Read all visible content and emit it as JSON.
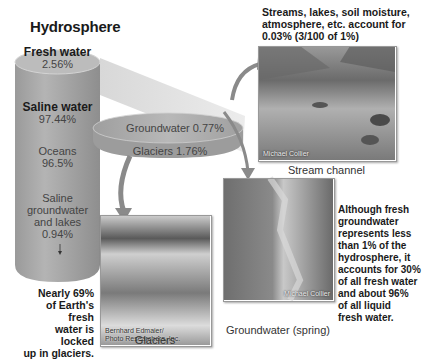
{
  "title": "Hydrosphere",
  "cylinder": {
    "fresh_label": "Fresh water",
    "fresh_value": "2.56%",
    "saline_label": "Saline water",
    "saline_value": "97.44%",
    "oceans_label": "Oceans",
    "oceans_value": "96.5%",
    "saline_gw_line1": "Saline",
    "saline_gw_line2": "groundwater",
    "saline_gw_line3": "and lakes",
    "saline_gw_value": "0.94%"
  },
  "disk": {
    "groundwater": "Groundwater 0.77%",
    "glaciers": "Glaciers 1.76%"
  },
  "streams_note": {
    "line1": "Streams, lakes, soil moisture,",
    "line2": "atmosphere, etc. account for",
    "line3": "0.03% (3/100 of 1%)"
  },
  "photos": {
    "stream": {
      "caption": "Stream channel",
      "credit": "Michael Collier"
    },
    "glaciers": {
      "caption": "Glaciers",
      "credit_line1": "Bernhard Edmaier/",
      "credit_line2": "Photo Researchers, Inc."
    },
    "spring": {
      "caption": "Groundwater (spring)",
      "credit": "Michael Collier"
    }
  },
  "glacier_note": {
    "line1": "Nearly 69%",
    "line2": "of Earth's fresh",
    "line3": "water is locked",
    "line4": "up in glaciers."
  },
  "groundwater_note": {
    "line1": "Although fresh",
    "line2": "groundwater",
    "line3": "represents less",
    "line4": "than 1% of the",
    "line5": "hydrosphere, it",
    "line6": "accounts for 30%",
    "line7": "of all fresh water",
    "line8": "and about 96%",
    "line9": "of all liquid",
    "line10": "fresh water."
  },
  "colors": {
    "cylinder_body": "#a8a8a8",
    "cylinder_top": "#bdbdbd",
    "disk": "#b0b0b0",
    "arrow": "#8a8a8a"
  }
}
